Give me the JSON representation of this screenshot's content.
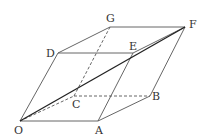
{
  "diagram": {
    "type": "parallelepiped",
    "labels": {
      "O": "O",
      "A": "A",
      "B": "B",
      "C": "C",
      "D": "D",
      "E": "E",
      "F": "F",
      "G": "G"
    },
    "stroke_color": "#444444",
    "diagonal": "OF"
  }
}
